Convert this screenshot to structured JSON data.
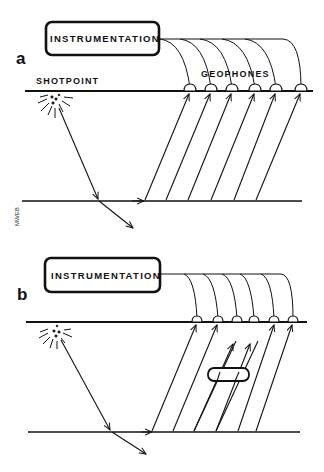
{
  "figure": {
    "panels": [
      {
        "letter": "a",
        "instrumentation_label": "INSTRUMENTATION",
        "shotpoint_label": "SHOTPOINT",
        "geophones_label": "GEOPHONES",
        "geophone_count": 6,
        "anomaly": false
      },
      {
        "letter": "b",
        "instrumentation_label": "INSTRUMENTATION",
        "geophone_count": 6,
        "anomaly": true
      }
    ],
    "signature": "MWEB",
    "colors": {
      "ink": "#111111",
      "background": "#ffffff"
    }
  }
}
